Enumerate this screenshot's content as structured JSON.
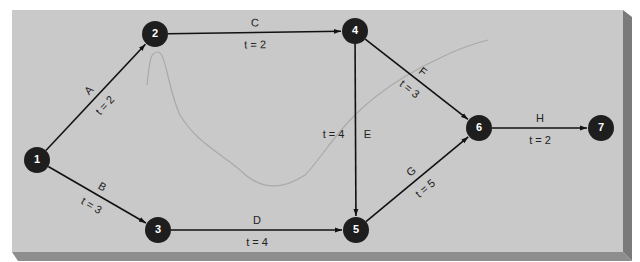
{
  "header": {
    "caption_fragment": "",
    "colors": {
      "panel": "#c9c9c9",
      "panel_bevel_right": "#7d7d7d",
      "panel_bevel_bottom": "#8e8e8e",
      "node_fill": "#1e1e1e",
      "node_text": "#ffffff",
      "edge": "#111111",
      "label": "#222222",
      "annotation_curve": "#a9a9a9"
    }
  },
  "network": {
    "nodes": [
      {
        "id": "1",
        "label": "1",
        "x": 37,
        "y": 160
      },
      {
        "id": "2",
        "label": "2",
        "x": 155,
        "y": 34
      },
      {
        "id": "3",
        "label": "3",
        "x": 158,
        "y": 230
      },
      {
        "id": "4",
        "label": "4",
        "x": 355,
        "y": 31
      },
      {
        "id": "5",
        "label": "5",
        "x": 356,
        "y": 230
      },
      {
        "id": "6",
        "label": "6",
        "x": 479,
        "y": 128
      },
      {
        "id": "7",
        "label": "7",
        "x": 601,
        "y": 128
      }
    ],
    "edges": [
      {
        "id": "A",
        "from": "1",
        "to": "2",
        "activity": "A",
        "time_label": "t = 2"
      },
      {
        "id": "B",
        "from": "1",
        "to": "3",
        "activity": "B",
        "time_label": "t = 3"
      },
      {
        "id": "C",
        "from": "2",
        "to": "4",
        "activity": "C",
        "time_label": "t = 2"
      },
      {
        "id": "D",
        "from": "3",
        "to": "5",
        "activity": "D",
        "time_label": "t = 4"
      },
      {
        "id": "E",
        "from": "4",
        "to": "5",
        "activity": "E",
        "time_label": "t = 4"
      },
      {
        "id": "F",
        "from": "4",
        "to": "6",
        "activity": "F",
        "time_label": "t = 3"
      },
      {
        "id": "G",
        "from": "5",
        "to": "6",
        "activity": "G",
        "time_label": "t = 5"
      },
      {
        "id": "H",
        "from": "6",
        "to": "7",
        "activity": "H",
        "time_label": "t = 2"
      }
    ]
  }
}
